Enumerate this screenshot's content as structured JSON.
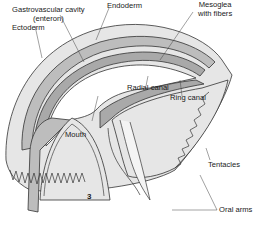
{
  "figure": {
    "number": "3",
    "colors": {
      "mesoglea": "#e6e6e6",
      "ectoderm_band": "#bdbdbd",
      "endoderm_band": "#a9a9a9",
      "outline": "#333333",
      "background": "#ffffff"
    }
  },
  "labels": {
    "gastrovascular_cavity_line1": "Gastrovascular cavity",
    "gastrovascular_cavity_line2": "(enteron)",
    "endoderm": "Endoderm",
    "mesoglea_line1": "Mesoglea",
    "mesoglea_line2": "with fibers",
    "ectoderm": "Ectoderm",
    "radial_canal": "Radial canal",
    "ring_canal": "Ring canal",
    "mouth": "Mouth",
    "tentacles": "Tentacles",
    "oral_arms": "Oral arms"
  }
}
